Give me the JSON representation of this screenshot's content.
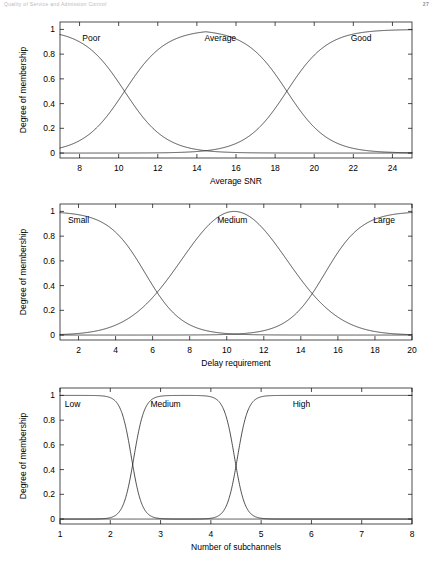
{
  "header": {
    "title": "Quality of Service and Admission Control",
    "page_number": "27"
  },
  "figure": {
    "name": "fuzzy-membership-functions"
  },
  "chart_data": [
    {
      "type": "line",
      "id": "average-snr",
      "title": "",
      "xlabel": "Average SNR",
      "ylabel": "Degree of membership",
      "xlim": [
        7,
        25
      ],
      "ylim": [
        -0.04,
        1.06
      ],
      "xticks": [
        8,
        10,
        12,
        14,
        16,
        18,
        20,
        22,
        24
      ],
      "yticks": [
        0,
        0.2,
        0.4,
        0.6,
        0.8,
        1
      ],
      "ytick_labels": [
        "0",
        "0.2",
        "0.4",
        "0.6",
        "0.8",
        "1"
      ],
      "grid": false,
      "legend": "inline-annotations",
      "annotations": [
        {
          "text": "Poor",
          "x": 8.6,
          "y": 0.93
        },
        {
          "text": "Average",
          "x": 15.2,
          "y": 0.93
        },
        {
          "text": "Good",
          "x": 22.4,
          "y": 0.93
        }
      ],
      "series": [
        {
          "name": "Poor",
          "shape": "sigmoid-falling",
          "center": 10.3,
          "width": 1.05,
          "plateau": 1.0
        },
        {
          "name": "Average",
          "shape": "trapezoid-smooth",
          "left_center": 10.3,
          "left_width": 1.05,
          "right_center": 18.6,
          "right_width": 1.05,
          "plateau": 1.0
        },
        {
          "name": "Good",
          "shape": "sigmoid-rising",
          "center": 18.6,
          "width": 1.05,
          "plateau": 1.0
        }
      ]
    },
    {
      "type": "line",
      "id": "delay-requirement",
      "title": "",
      "xlabel": "Delay requirement",
      "ylabel": "Degree of membership",
      "xlim": [
        1,
        20
      ],
      "ylim": [
        -0.04,
        1.06
      ],
      "xticks": [
        2,
        4,
        6,
        8,
        10,
        12,
        14,
        16,
        18,
        20
      ],
      "yticks": [
        0,
        0.2,
        0.4,
        0.6,
        0.8,
        1
      ],
      "ytick_labels": [
        "0",
        "0.2",
        "0.4",
        "0.6",
        "0.8",
        "1"
      ],
      "grid": false,
      "legend": "inline-annotations",
      "annotations": [
        {
          "text": "Small",
          "x": 2.0,
          "y": 0.93
        },
        {
          "text": "Medium",
          "x": 10.3,
          "y": 0.93
        },
        {
          "text": "Large",
          "x": 18.5,
          "y": 0.93
        }
      ],
      "series": [
        {
          "name": "Small",
          "shape": "sigmoid-falling",
          "center": 5.6,
          "width": 1.0,
          "plateau": 1.0
        },
        {
          "name": "Medium",
          "shape": "gaussian",
          "center": 10.4,
          "sigma": 2.85,
          "peak": 1.0
        },
        {
          "name": "Large",
          "shape": "sigmoid-rising",
          "center": 15.3,
          "width": 1.0,
          "plateau": 1.0
        }
      ]
    },
    {
      "type": "line",
      "id": "number-of-subchannels",
      "title": "",
      "xlabel": "Number of subchannels",
      "ylabel": "Degree of membership",
      "xlim": [
        1,
        8
      ],
      "ylim": [
        -0.04,
        1.06
      ],
      "xticks": [
        1,
        2,
        3,
        4,
        5,
        6,
        7,
        8
      ],
      "yticks": [
        0,
        0.2,
        0.4,
        0.6,
        0.8,
        1
      ],
      "ytick_labels": [
        "0",
        "0.2",
        "0.4",
        "0.6",
        "0.8",
        "1"
      ],
      "grid": false,
      "legend": "inline-annotations",
      "annotations": [
        {
          "text": "Low",
          "x": 1.25,
          "y": 0.93
        },
        {
          "text": "Medium",
          "x": 3.1,
          "y": 0.93
        },
        {
          "text": "High",
          "x": 5.8,
          "y": 0.93
        }
      ],
      "series": [
        {
          "name": "Low",
          "shape": "sigmoid-falling",
          "center": 2.42,
          "width": 0.105,
          "plateau": 1.0
        },
        {
          "name": "Medium",
          "shape": "trapezoid-smooth",
          "left_center": 2.47,
          "left_width": 0.105,
          "right_center": 4.47,
          "right_width": 0.105,
          "plateau": 1.0
        },
        {
          "name": "High",
          "shape": "sigmoid-rising",
          "center": 4.53,
          "width": 0.105,
          "plateau": 1.0
        }
      ]
    }
  ]
}
